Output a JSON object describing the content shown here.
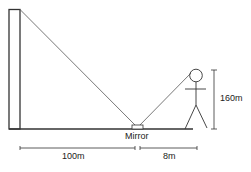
{
  "diagram": {
    "labels": {
      "mirror": "Mirror",
      "person_height": "160m",
      "distance_tower_to_mirror": "100m",
      "distance_mirror_to_person": "8m"
    },
    "elements": [
      "tower",
      "ground",
      "mirror",
      "person",
      "light-ray-tower-to-mirror",
      "light-ray-mirror-to-eye",
      "height-dimension",
      "distance-dimensions"
    ],
    "colors": {
      "stroke": "#333333",
      "text": "#222222",
      "background": "#ffffff"
    }
  }
}
